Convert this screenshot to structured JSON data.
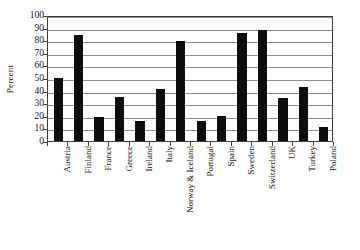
{
  "chart_data": {
    "type": "bar",
    "title": "",
    "subtitle": "",
    "xlabel": "",
    "ylabel": "Percent",
    "ylim": [
      0,
      100
    ],
    "ytick_step": 10,
    "yticks": [
      100,
      90,
      80,
      70,
      60,
      50,
      40,
      30,
      20,
      10,
      0
    ],
    "grid": true,
    "legend": false,
    "legend_position": "none",
    "bar_color": "#0d0d0d",
    "categories": [
      "Austria",
      "Finland",
      "France",
      "Greece",
      "Ireland",
      "Italy",
      "Norway & Iceland",
      "Portugal",
      "Spain",
      "Sweden",
      "Switzerland",
      "UK",
      "Turkey",
      "Poland"
    ],
    "values": [
      50,
      84,
      19,
      35,
      16,
      41,
      79,
      16,
      20,
      86,
      88,
      34,
      43,
      11
    ]
  },
  "axes": {
    "y_title": "Percent"
  }
}
